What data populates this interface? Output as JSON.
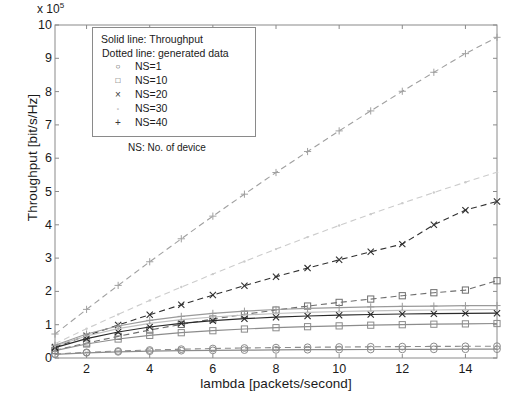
{
  "chart_data": {
    "type": "line",
    "title": "",
    "xlabel": "lambda [packets/second]",
    "ylabel": "Throughput [bit/s/Hz]",
    "y_exponent_label": "x 10",
    "y_exponent_power": "5",
    "xlim": [
      1,
      15
    ],
    "ylim": [
      0,
      1000000
    ],
    "y_scale_factor": 100000,
    "xticks": [
      2,
      4,
      6,
      8,
      10,
      12,
      14
    ],
    "yticks": [
      0,
      1,
      2,
      3,
      4,
      5,
      6,
      7,
      8,
      9,
      10
    ],
    "grid": false,
    "legend_position": "upper-left-inside",
    "x": [
      1,
      2,
      3,
      4,
      5,
      6,
      7,
      8,
      9,
      10,
      11,
      12,
      13,
      14,
      15
    ],
    "series": [
      {
        "name": "NS=1 generated data",
        "style": "dotted",
        "marker": "circle",
        "color": "#8c8c8c",
        "values": [
          12000,
          17000,
          21000,
          24000,
          26500,
          28500,
          30000,
          31200,
          32200,
          33000,
          33700,
          34200,
          34700,
          35100,
          35500
        ]
      },
      {
        "name": "NS=1 throughput",
        "style": "solid",
        "marker": "circle",
        "color": "#8c8c8c",
        "values": [
          11000,
          15500,
          18500,
          20500,
          22000,
          23000,
          23800,
          24400,
          24900,
          25300,
          25600,
          25900,
          26100,
          26300,
          26500
        ]
      },
      {
        "name": "NS=10 generated data",
        "style": "dotted",
        "marker": "square",
        "color": "#6e6e6e",
        "values": [
          23000,
          45000,
          65000,
          84000,
          101000,
          117000,
          131000,
          144000,
          156000,
          167000,
          177000,
          187000,
          196000,
          204000,
          232000
        ]
      },
      {
        "name": "NS=10 throughput",
        "style": "solid",
        "marker": "square",
        "color": "#8c8c8c",
        "values": [
          22000,
          42000,
          57000,
          68000,
          76000,
          82000,
          87000,
          91000,
          94000,
          96500,
          98500,
          100000,
          101500,
          102500,
          103500
        ]
      },
      {
        "name": "NS=20 generated data",
        "style": "dotted",
        "marker": "x",
        "color": "#303030",
        "values": [
          33000,
          67000,
          99000,
          130000,
          160000,
          189000,
          217000,
          244000,
          270000,
          295000,
          319000,
          342000,
          400000,
          444000,
          470000
        ]
      },
      {
        "name": "NS=20 throughput",
        "style": "solid",
        "marker": "x",
        "color": "#2a2a2a",
        "values": [
          31000,
          58000,
          78000,
          93000,
          104000,
          112000,
          118000,
          122500,
          126000,
          128500,
          130500,
          132000,
          133000,
          134000,
          134500
        ]
      },
      {
        "name": "NS=30 generated data",
        "style": "dotted",
        "marker": "dot",
        "color": "#cccccc",
        "values": [
          43000,
          88000,
          131000,
          173000,
          213000,
          252000,
          290000,
          327000,
          363000,
          398000,
          432000,
          465000,
          497000,
          528000,
          558000
        ]
      },
      {
        "name": "NS=30 throughput",
        "style": "solid",
        "marker": "dot",
        "color": "#c0c0c0",
        "values": [
          36000,
          66000,
          88000,
          104000,
          115000,
          123000,
          129000,
          133500,
          137000,
          139500,
          141500,
          143000,
          144000,
          145000,
          145500
        ]
      },
      {
        "name": "NS=40 generated data",
        "style": "dotted",
        "marker": "plus",
        "color": "#a0a0a0",
        "values": [
          72000,
          146000,
          218000,
          289000,
          358000,
          426000,
          492000,
          557000,
          620000,
          682000,
          742000,
          801000,
          858000,
          914000,
          963000
        ]
      },
      {
        "name": "NS=40 throughput",
        "style": "solid",
        "marker": "plus",
        "color": "#9a9a9a",
        "values": [
          38000,
          72000,
          96000,
          113000,
          125000,
          134000,
          140500,
          145500,
          149000,
          151500,
          153500,
          155000,
          156000,
          157000,
          157500
        ]
      }
    ]
  },
  "axes": {
    "yticklabels": [
      "0",
      "1",
      "2",
      "3",
      "4",
      "5",
      "6",
      "7",
      "8",
      "9",
      "10"
    ],
    "xticklabels": [
      "2",
      "4",
      "6",
      "8",
      "10",
      "12",
      "14"
    ],
    "exponent_prefix": "x 10",
    "exponent_power": "5",
    "xlabel": "lambda [packets/second]",
    "ylabel": "Throughput [bit/s/Hz]"
  },
  "legend": {
    "header_line1": "Solid line: Throughput",
    "header_line2": "Dotted line: generated data",
    "footer": "NS: No. of device",
    "entries": [
      {
        "marker": "circle",
        "glyph": "○",
        "label": "NS=1"
      },
      {
        "marker": "square",
        "glyph": "□",
        "label": "NS=10"
      },
      {
        "marker": "x",
        "glyph": "×",
        "label": "NS=20"
      },
      {
        "marker": "dot",
        "glyph": "·",
        "label": "NS=30"
      },
      {
        "marker": "plus",
        "glyph": "+",
        "label": "NS=40"
      }
    ]
  }
}
